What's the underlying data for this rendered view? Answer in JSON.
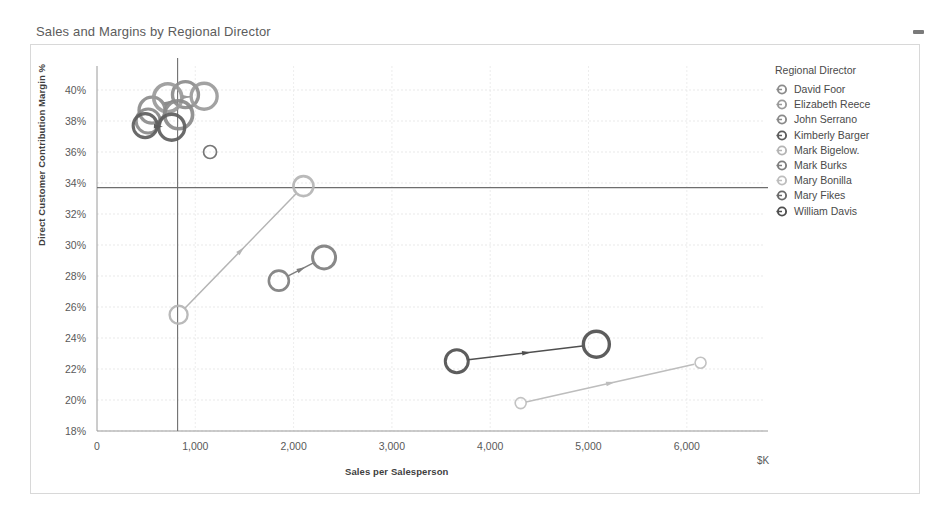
{
  "header": {
    "title": "Sales and Margins by Regional Director",
    "minimize_icon": "minimize-icon"
  },
  "legend": {
    "title": "Regional Director",
    "position": "right",
    "items": [
      {
        "label": "David Foor",
        "color": "#8c8c8c"
      },
      {
        "label": "Elizabeth Reece",
        "color": "#9a9a9a"
      },
      {
        "label": "John Serrano",
        "color": "#8a8a8a"
      },
      {
        "label": "Kimberly Barger",
        "color": "#5d5d5d"
      },
      {
        "label": "Mark Bigelow.",
        "color": "#b4b4b4"
      },
      {
        "label": "Mark Burks",
        "color": "#7e7e7e"
      },
      {
        "label": "Mary Bonilla",
        "color": "#bdbdbd"
      },
      {
        "label": "Mary Fikes",
        "color": "#6a6a6a"
      },
      {
        "label": "William Davis",
        "color": "#4f4f4f"
      }
    ]
  },
  "axes": {
    "y_ticks": [
      "18%",
      "20%",
      "22%",
      "24%",
      "26%",
      "28%",
      "30%",
      "32%",
      "34%",
      "36%",
      "38%",
      "40%"
    ],
    "x_ticks": [
      "0",
      "1,000",
      "2,000",
      "3,000",
      "4,000",
      "5,000",
      "6,000"
    ],
    "y_title": "Direct Customer Contribution Margin %",
    "x_title": "Sales per Salesperson",
    "x_unit": "$K"
  },
  "chart_data": {
    "type": "scatter",
    "title": "Sales and Margins by Regional Director",
    "xlabel": "Sales per Salesperson",
    "ylabel": "Direct Customer Contribution Margin %",
    "xunit": "$K",
    "xlim": [
      0,
      6600
    ],
    "ylim": [
      18,
      41
    ],
    "x_ticks": [
      0,
      1000,
      2000,
      3000,
      4000,
      5000,
      6000
    ],
    "y_ticks": [
      18,
      20,
      22,
      24,
      26,
      28,
      30,
      32,
      34,
      36,
      38,
      40
    ],
    "grid": true,
    "legend_position": "right",
    "reference_lines": [
      {
        "orientation": "horizontal",
        "value": 33.7,
        "color": "#6e6e6e"
      },
      {
        "orientation": "vertical",
        "value": 820,
        "color": "#6e6e6e"
      }
    ],
    "series": [
      {
        "name": "David Foor",
        "color": "#8c8c8c",
        "points": [
          {
            "x": 560,
            "y": 38.7,
            "size": 26
          },
          {
            "x": 900,
            "y": 39.7,
            "size": 26
          }
        ],
        "trajectory": true
      },
      {
        "name": "Elizabeth Reece",
        "color": "#9a9a9a",
        "points": [
          {
            "x": 720,
            "y": 39.5,
            "size": 28
          },
          {
            "x": 1090,
            "y": 39.6,
            "size": 26
          }
        ],
        "trajectory": true
      },
      {
        "name": "John Serrano",
        "color": "#8a8a8a",
        "points": [
          {
            "x": 520,
            "y": 38.0,
            "size": 24
          },
          {
            "x": 830,
            "y": 38.4,
            "size": 28
          }
        ],
        "trajectory": true
      },
      {
        "name": "Kimberly Barger",
        "color": "#5d5d5d",
        "points": [
          {
            "x": 490,
            "y": 37.7,
            "size": 24
          },
          {
            "x": 760,
            "y": 37.6,
            "size": 26
          }
        ],
        "trajectory": true
      },
      {
        "name": "Mark Bigelow.",
        "color": "#b4b4b4",
        "points": [
          {
            "x": 830,
            "y": 25.5,
            "size": 18
          },
          {
            "x": 2100,
            "y": 33.8,
            "size": 20
          }
        ],
        "trajectory": true
      },
      {
        "name": "Mark Burks",
        "color": "#7e7e7e",
        "points": [
          {
            "x": 1850,
            "y": 27.7,
            "size": 20
          },
          {
            "x": 2310,
            "y": 29.2,
            "size": 23
          }
        ],
        "trajectory": true
      },
      {
        "name": "Mary Bonilla",
        "color": "#bdbdbd",
        "points": [
          {
            "x": 4310,
            "y": 19.8,
            "size": 11
          },
          {
            "x": 6140,
            "y": 22.4,
            "size": 11
          }
        ],
        "trajectory": true
      },
      {
        "name": "Mary Fikes",
        "color": "#6a6a6a",
        "points": [
          {
            "x": 1150,
            "y": 36.0,
            "size": 13
          }
        ],
        "trajectory": false
      },
      {
        "name": "William Davis",
        "color": "#4f4f4f",
        "points": [
          {
            "x": 3660,
            "y": 22.5,
            "size": 23
          },
          {
            "x": 5080,
            "y": 23.6,
            "size": 26
          }
        ],
        "trajectory": true
      }
    ]
  }
}
